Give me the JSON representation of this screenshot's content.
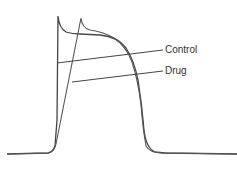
{
  "diagram": {
    "title": "",
    "type": "cardiac action potential comparison",
    "labels": {
      "control": "Control",
      "drug": "Drug"
    },
    "colors": {
      "trace": "#444444",
      "background": "#ffffff"
    }
  }
}
